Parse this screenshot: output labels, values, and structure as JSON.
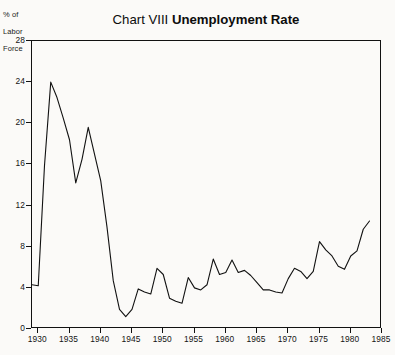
{
  "chart_data": {
    "type": "line",
    "title": "Chart VIII Unemployment Rate",
    "title_parts": {
      "regular": "Chart VIII",
      "bold": "Unemployment Rate"
    },
    "ylabel": "% of Labor Force",
    "ylabel_lines": [
      "% of",
      "Labor",
      "Force"
    ],
    "xlabel": "",
    "xlim": [
      1929,
      1985
    ],
    "ylim": [
      0,
      28
    ],
    "grid": false,
    "legend": null,
    "line_color": "#111111",
    "series_name": "Unemployment Rate",
    "yticks": [
      0,
      4,
      8,
      12,
      16,
      20,
      24,
      28
    ],
    "ytick_labels": [
      "0",
      "4",
      "8",
      "12",
      "16",
      "20",
      "24",
      "28"
    ],
    "xticks": [
      1930,
      1935,
      1940,
      1945,
      1950,
      1955,
      1960,
      1965,
      1970,
      1975,
      1980,
      1985
    ],
    "xtick_labels": [
      "1930",
      "1935",
      "1940",
      "1945",
      "1950",
      "1955",
      "1960",
      "1965",
      "1970",
      "1975",
      "1980",
      "1985"
    ],
    "x": [
      1929,
      1930,
      1931,
      1932,
      1933,
      1934,
      1935,
      1936,
      1937,
      1938,
      1939,
      1940,
      1941,
      1942,
      1943,
      1944,
      1945,
      1946,
      1947,
      1948,
      1949,
      1950,
      1951,
      1952,
      1953,
      1954,
      1955,
      1956,
      1957,
      1958,
      1959,
      1960,
      1961,
      1962,
      1963,
      1964,
      1965,
      1966,
      1967,
      1968,
      1969,
      1970,
      1971,
      1972,
      1973,
      1974,
      1975,
      1976,
      1977,
      1978,
      1979,
      1980,
      1981,
      1982,
      1983
    ],
    "values": [
      4.3,
      4.2,
      15.9,
      24.0,
      22.5,
      20.5,
      18.4,
      14.2,
      16.5,
      19.6,
      17.0,
      14.4,
      9.9,
      4.7,
      1.9,
      1.2,
      1.9,
      3.9,
      3.6,
      3.4,
      5.9,
      5.3,
      3.0,
      2.7,
      2.5,
      5.0,
      4.0,
      3.8,
      4.3,
      6.8,
      5.3,
      5.5,
      6.7,
      5.5,
      5.7,
      5.2,
      4.5,
      3.8,
      3.8,
      3.6,
      3.5,
      4.9,
      5.9,
      5.6,
      4.9,
      5.6,
      8.5,
      7.7,
      7.1,
      6.1,
      5.8,
      7.1,
      7.6,
      9.7,
      10.5
    ]
  }
}
